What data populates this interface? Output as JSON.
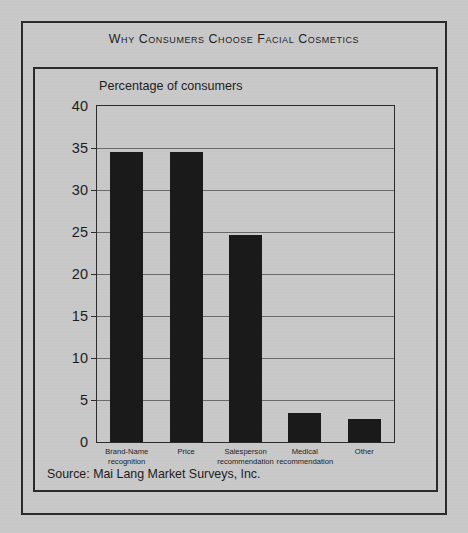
{
  "figure": {
    "title": "Why Consumers Choose Facial Cosmetics",
    "axis_caption": "Percentage of consumers",
    "source_note": "Source: Mai Lang Market Surveys, Inc.",
    "bar_color": "#1a1a1a",
    "background_color": "#c9c9c9",
    "frame_color": "#2b2b2b",
    "gridline_color": "#6a6a6a"
  },
  "chart_data": {
    "type": "bar",
    "title": "Why Consumers Choose Facial Cosmetics",
    "subtitle": "Percentage of consumers",
    "xlabel": "",
    "ylabel": "Percentage of consumers",
    "ylim": [
      0,
      40
    ],
    "ytick_labels": [
      "40",
      "35",
      "30",
      "25",
      "20",
      "15",
      "10",
      "5",
      "0"
    ],
    "yticks": [
      40,
      35,
      30,
      25,
      20,
      15,
      10,
      5,
      0
    ],
    "grid": true,
    "legend": "none",
    "categories": [
      "Brand-Name recognition",
      "Price",
      "Salesperson recommendation",
      "Medical recommendation",
      "Other"
    ],
    "category_lines": [
      [
        "Brand-Name",
        "recognition"
      ],
      [
        "Price",
        ""
      ],
      [
        "Salesperson",
        "recommendation"
      ],
      [
        "Medical",
        "recommendation"
      ],
      [
        "Other",
        ""
      ]
    ],
    "values": [
      34.5,
      34.5,
      24.7,
      3.5,
      2.7
    ],
    "source": "Source: Mai Lang Market Surveys, Inc."
  }
}
